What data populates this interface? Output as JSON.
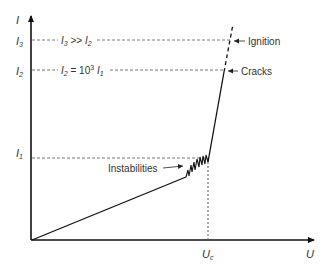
{
  "diagram": {
    "type": "line",
    "axes": {
      "x_label": "U",
      "y_label": "I",
      "x_tick": {
        "label": "U",
        "sub": "c"
      }
    },
    "levels": [
      {
        "name": "I1",
        "label": "I",
        "sub": "1",
        "y": 158
      },
      {
        "name": "I2",
        "label": "I",
        "sub": "2",
        "y": 70,
        "relation": {
          "lhs": "I",
          "lhs_sub": "2",
          "mid": " = 10",
          "sup": "3",
          "rhs": " I",
          "rhs_sub": "1"
        }
      },
      {
        "name": "I3",
        "label": "I",
        "sub": "3",
        "y": 40,
        "relation": {
          "lhs": "I",
          "lhs_sub": "3",
          "mid": " >> ",
          "rhs": "I",
          "rhs_sub": "2"
        }
      }
    ],
    "annotations": {
      "instabilities": "Instabilities",
      "cracks": "Cracks",
      "ignition": "Ignition"
    },
    "colors": {
      "line": "#111111",
      "dash": "#555555",
      "text": "#333333"
    }
  }
}
